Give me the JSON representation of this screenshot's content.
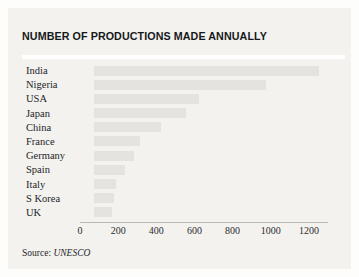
{
  "card": {
    "title": "NUMBER OF PRODUCTIONS MADE ANNUALLY",
    "source_label": "Source:",
    "source_value": "UNESCO"
  },
  "colors": {
    "page_background": "#fdfdfc",
    "card_background": "#f3f2ef",
    "bar_fill": "#e4e3e0",
    "title_text": "#16181a",
    "axis_line": "#b9b8b4",
    "rule": "#ffffff"
  },
  "chart_data": {
    "type": "bar",
    "orientation": "horizontal",
    "title": "NUMBER OF PRODUCTIONS MADE ANNUALLY",
    "xlabel": "",
    "ylabel": "",
    "categories": [
      "India",
      "Nigeria",
      "USA",
      "Japan",
      "China",
      "France",
      "Germany",
      "Spain",
      "Italy",
      "S Korea",
      "UK"
    ],
    "values": [
      1180,
      900,
      550,
      480,
      350,
      240,
      210,
      165,
      115,
      105,
      95
    ],
    "xlim": [
      0,
      1300
    ],
    "xticks": [
      0,
      200,
      400,
      600,
      800,
      1000,
      1200
    ],
    "xticklabels": [
      "0",
      "200",
      "400",
      "600",
      "800",
      "1000",
      "1200"
    ],
    "grid": false,
    "legend": false,
    "source": "Source: UNESCO"
  }
}
